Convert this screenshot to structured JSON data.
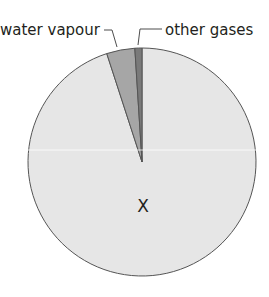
{
  "chart_data": {
    "type": "pie",
    "title": "",
    "categories": [
      "X",
      "water vapour",
      "other gases"
    ],
    "values": [
      95,
      4,
      1
    ],
    "units": "approximate percent (read from slice angles)",
    "start_angle_deg": 0,
    "direction": "counterclockwise from top for small slices",
    "colors": [
      "#e6e6e6",
      "#a6a6a6",
      "#7a7a7a"
    ],
    "labels": {
      "center_label": "X",
      "water_vapour": "water vapour",
      "other_gases": "other gases"
    },
    "legend": "none (leader-line labels)"
  },
  "labels": {
    "water_vapour": "water vapour",
    "other_gases": "other gases",
    "x": "X"
  }
}
